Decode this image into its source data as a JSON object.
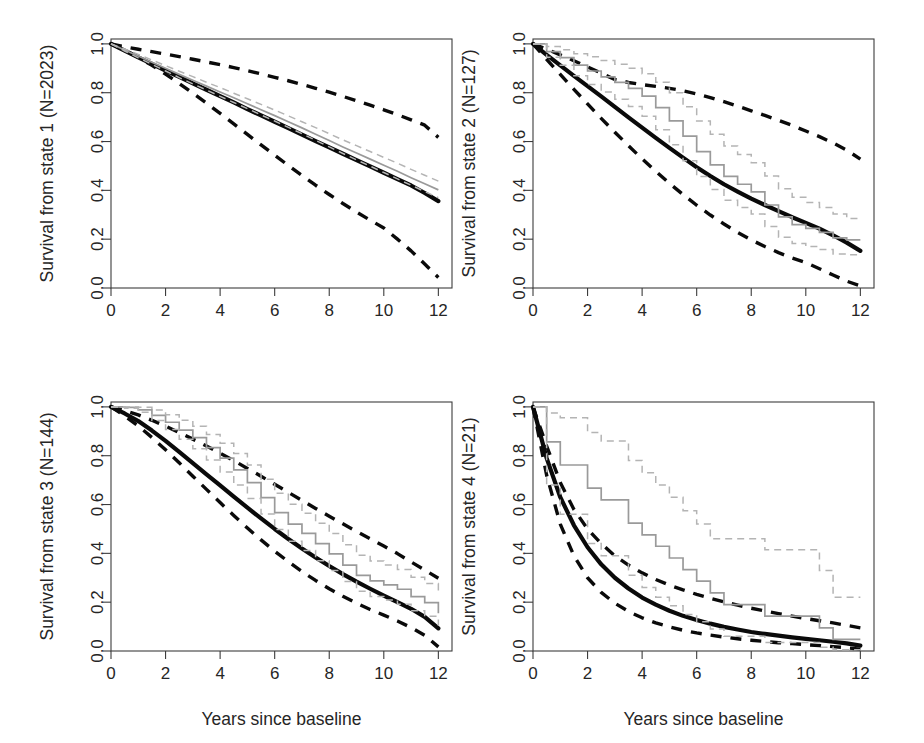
{
  "figure": {
    "title": "",
    "layout": "2x2 panel grid of survival curves",
    "xlabel": "Years since baseline",
    "panel_count": 4
  },
  "chart_data": [
    {
      "type": "line",
      "panel": 1,
      "title": "",
      "ylabel": "Survival from state 1 (N=2023)",
      "xlabel": "",
      "xlim": [
        0,
        12.5
      ],
      "ylim": [
        0,
        1.02
      ],
      "xticks": [
        0,
        2,
        4,
        6,
        8,
        10,
        12
      ],
      "xtick_labels": [
        "0",
        "2",
        "4",
        "6",
        "8",
        "10",
        "12"
      ],
      "yticks": [
        0.0,
        0.2,
        0.4,
        0.6,
        0.8,
        1.0
      ],
      "ytick_labels": [
        "0.0",
        "0.2",
        "0.4",
        "0.6",
        "0.8",
        "1.0"
      ],
      "grid": false,
      "legend": "none",
      "x": [
        0,
        0.5,
        1,
        1.5,
        2,
        2.5,
        3,
        3.5,
        4,
        4.5,
        5,
        5.5,
        6,
        6.5,
        7,
        7.5,
        8,
        8.5,
        9,
        9.5,
        10,
        10.5,
        11,
        11.5,
        12
      ],
      "series": [
        {
          "name": "model-fit",
          "style": "solid-thick-black",
          "values": [
            1.0,
            0.972,
            0.945,
            0.918,
            0.891,
            0.865,
            0.838,
            0.812,
            0.786,
            0.76,
            0.733,
            0.707,
            0.681,
            0.655,
            0.628,
            0.602,
            0.576,
            0.55,
            0.524,
            0.498,
            0.472,
            0.446,
            0.42,
            0.389,
            0.356
          ]
        },
        {
          "name": "model-ci-upper",
          "style": "dashed-thick-black",
          "values": [
            1.0,
            0.988,
            0.978,
            0.968,
            0.958,
            0.948,
            0.937,
            0.926,
            0.915,
            0.903,
            0.89,
            0.877,
            0.863,
            0.849,
            0.834,
            0.818,
            0.802,
            0.785,
            0.767,
            0.749,
            0.73,
            0.71,
            0.689,
            0.667,
            0.617
          ]
        },
        {
          "name": "model-ci-lower",
          "style": "dashed-thick-black",
          "values": [
            1.0,
            0.975,
            0.945,
            0.912,
            0.876,
            0.838,
            0.798,
            0.757,
            0.715,
            0.672,
            0.629,
            0.586,
            0.544,
            0.502,
            0.461,
            0.421,
            0.383,
            0.346,
            0.311,
            0.278,
            0.246,
            0.2,
            0.152,
            0.098,
            0.043
          ]
        },
        {
          "name": "kaplan-meier",
          "style": "solid-thin-gray",
          "values": [
            1.0,
            0.975,
            0.95,
            0.925,
            0.9,
            0.875,
            0.851,
            0.827,
            0.803,
            0.779,
            0.755,
            0.73,
            0.706,
            0.681,
            0.656,
            0.63,
            0.604,
            0.578,
            0.553,
            0.528,
            0.503,
            0.478,
            0.452,
            0.427,
            0.402
          ]
        },
        {
          "name": "kaplan-meier-ci-upper",
          "style": "dashed-thin-gray",
          "values": [
            1.0,
            0.979,
            0.957,
            0.934,
            0.911,
            0.888,
            0.866,
            0.843,
            0.821,
            0.798,
            0.775,
            0.752,
            0.729,
            0.705,
            0.681,
            0.657,
            0.632,
            0.607,
            0.583,
            0.559,
            0.535,
            0.511,
            0.486,
            0.462,
            0.438
          ]
        },
        {
          "name": "kaplan-meier-ci-lower",
          "style": "dashed-thin-gray",
          "values": [
            1.0,
            0.971,
            0.943,
            0.916,
            0.889,
            0.862,
            0.836,
            0.811,
            0.785,
            0.76,
            0.735,
            0.709,
            0.684,
            0.658,
            0.632,
            0.605,
            0.578,
            0.551,
            0.525,
            0.499,
            0.473,
            0.447,
            0.421,
            0.395,
            0.37
          ]
        }
      ]
    },
    {
      "type": "line",
      "panel": 2,
      "title": "",
      "ylabel": "Survival from state 2 (N=127)",
      "xlabel": "",
      "xlim": [
        0,
        12.5
      ],
      "ylim": [
        0,
        1.02
      ],
      "xticks": [
        0,
        2,
        4,
        6,
        8,
        10,
        12
      ],
      "xtick_labels": [
        "0",
        "2",
        "4",
        "6",
        "8",
        "10",
        "12"
      ],
      "yticks": [
        0.0,
        0.2,
        0.4,
        0.6,
        0.8,
        1.0
      ],
      "ytick_labels": [
        "0.0",
        "0.2",
        "0.4",
        "0.6",
        "0.8",
        "1.0"
      ],
      "grid": false,
      "legend": "none",
      "x": [
        0,
        0.5,
        1,
        1.5,
        2,
        2.5,
        3,
        3.5,
        4,
        4.5,
        5,
        5.5,
        6,
        6.5,
        7,
        7.5,
        8,
        8.5,
        9,
        9.5,
        10,
        10.5,
        11,
        11.5,
        12
      ],
      "series": [
        {
          "name": "model-fit",
          "style": "solid-thick-black",
          "values": [
            1.0,
            0.955,
            0.912,
            0.869,
            0.827,
            0.785,
            0.742,
            0.699,
            0.657,
            0.615,
            0.574,
            0.534,
            0.495,
            0.459,
            0.425,
            0.395,
            0.366,
            0.34,
            0.315,
            0.29,
            0.267,
            0.243,
            0.216,
            0.186,
            0.152
          ]
        },
        {
          "name": "model-ci-upper",
          "style": "dashed-thick-black",
          "values": [
            1.0,
            0.978,
            0.955,
            0.931,
            0.906,
            0.88,
            0.854,
            0.842,
            0.833,
            0.826,
            0.818,
            0.808,
            0.795,
            0.78,
            0.763,
            0.745,
            0.726,
            0.707,
            0.687,
            0.666,
            0.643,
            0.62,
            0.594,
            0.565,
            0.528
          ]
        },
        {
          "name": "model-ci-lower",
          "style": "dashed-thick-black",
          "values": [
            1.0,
            0.937,
            0.875,
            0.814,
            0.754,
            0.695,
            0.638,
            0.583,
            0.529,
            0.478,
            0.429,
            0.383,
            0.339,
            0.299,
            0.262,
            0.228,
            0.197,
            0.17,
            0.145,
            0.123,
            0.104,
            0.079,
            0.053,
            0.028,
            0.009
          ]
        },
        {
          "name": "kaplan-meier",
          "style": "solid-thin-gray-step",
          "values": [
            1.0,
            0.968,
            0.944,
            0.913,
            0.889,
            0.865,
            0.842,
            0.818,
            0.786,
            0.739,
            0.685,
            0.622,
            0.559,
            0.504,
            0.457,
            0.425,
            0.394,
            0.34,
            0.291,
            0.26,
            0.244,
            0.228,
            0.205,
            0.197,
            0.197
          ]
        },
        {
          "name": "kaplan-meier-ci-upper",
          "style": "dashed-thin-gray-step",
          "values": [
            1.0,
            0.989,
            0.976,
            0.96,
            0.947,
            0.932,
            0.917,
            0.9,
            0.878,
            0.843,
            0.8,
            0.742,
            0.684,
            0.63,
            0.582,
            0.547,
            0.513,
            0.459,
            0.407,
            0.372,
            0.35,
            0.33,
            0.303,
            0.285,
            0.277
          ]
        },
        {
          "name": "kaplan-meier-ci-lower",
          "style": "dashed-thin-gray-step",
          "values": [
            1.0,
            0.945,
            0.912,
            0.869,
            0.834,
            0.803,
            0.773,
            0.744,
            0.704,
            0.648,
            0.587,
            0.521,
            0.457,
            0.404,
            0.359,
            0.33,
            0.303,
            0.252,
            0.208,
            0.182,
            0.17,
            0.158,
            0.139,
            0.136,
            0.136
          ]
        }
      ]
    },
    {
      "type": "line",
      "panel": 3,
      "title": "",
      "ylabel": "Survival from state 3 (N=144)",
      "xlabel": "Years since baseline",
      "xlim": [
        0,
        12.5
      ],
      "ylim": [
        0,
        1.02
      ],
      "xticks": [
        0,
        2,
        4,
        6,
        8,
        10,
        12
      ],
      "xtick_labels": [
        "0",
        "2",
        "4",
        "6",
        "8",
        "10",
        "12"
      ],
      "yticks": [
        0.0,
        0.2,
        0.4,
        0.6,
        0.8,
        1.0
      ],
      "ytick_labels": [
        "0.0",
        "0.2",
        "0.4",
        "0.6",
        "0.8",
        "1.0"
      ],
      "grid": false,
      "legend": "none",
      "x": [
        0,
        0.5,
        1,
        1.5,
        2,
        2.5,
        3,
        3.5,
        4,
        4.5,
        5,
        5.5,
        6,
        6.5,
        7,
        7.5,
        8,
        8.5,
        9,
        9.5,
        10,
        10.5,
        11,
        11.5,
        12
      ],
      "series": [
        {
          "name": "model-fit",
          "style": "solid-thick-black",
          "values": [
            1.0,
            0.973,
            0.942,
            0.903,
            0.861,
            0.816,
            0.77,
            0.724,
            0.678,
            0.632,
            0.587,
            0.543,
            0.5,
            0.459,
            0.42,
            0.383,
            0.348,
            0.315,
            0.284,
            0.255,
            0.227,
            0.2,
            0.173,
            0.14,
            0.093
          ]
        },
        {
          "name": "model-ci-upper",
          "style": "dashed-thick-black",
          "values": [
            1.0,
            0.985,
            0.967,
            0.945,
            0.921,
            0.895,
            0.868,
            0.84,
            0.81,
            0.78,
            0.748,
            0.716,
            0.683,
            0.65,
            0.617,
            0.584,
            0.552,
            0.521,
            0.49,
            0.46,
            0.43,
            0.399,
            0.365,
            0.332,
            0.298
          ]
        },
        {
          "name": "model-ci-lower",
          "style": "dashed-thick-black",
          "values": [
            1.0,
            0.963,
            0.922,
            0.875,
            0.824,
            0.771,
            0.716,
            0.662,
            0.608,
            0.555,
            0.504,
            0.455,
            0.409,
            0.366,
            0.326,
            0.289,
            0.255,
            0.224,
            0.196,
            0.17,
            0.147,
            0.123,
            0.096,
            0.064,
            0.017
          ]
        },
        {
          "name": "kaplan-meier",
          "style": "solid-thin-gray-step",
          "values": [
            1.0,
            0.998,
            0.988,
            0.965,
            0.937,
            0.905,
            0.874,
            0.833,
            0.79,
            0.742,
            0.69,
            0.628,
            0.567,
            0.52,
            0.482,
            0.44,
            0.398,
            0.352,
            0.31,
            0.287,
            0.271,
            0.253,
            0.223,
            0.198,
            0.155
          ]
        },
        {
          "name": "kaplan-meier-ci-upper",
          "style": "dashed-thin-gray-step",
          "values": [
            1.0,
            1.0,
            0.998,
            0.987,
            0.968,
            0.945,
            0.921,
            0.887,
            0.851,
            0.809,
            0.762,
            0.704,
            0.646,
            0.601,
            0.564,
            0.523,
            0.481,
            0.435,
            0.392,
            0.369,
            0.352,
            0.334,
            0.302,
            0.276,
            0.233
          ]
        },
        {
          "name": "kaplan-meier-ci-lower",
          "style": "dashed-thin-gray-step",
          "values": [
            1.0,
            0.994,
            0.978,
            0.944,
            0.907,
            0.867,
            0.829,
            0.782,
            0.733,
            0.68,
            0.625,
            0.561,
            0.498,
            0.45,
            0.412,
            0.37,
            0.33,
            0.285,
            0.245,
            0.223,
            0.209,
            0.192,
            0.165,
            0.142,
            0.103
          ]
        }
      ]
    },
    {
      "type": "line",
      "panel": 4,
      "title": "",
      "ylabel": "Survival from state 4 (N=21)",
      "xlabel": "Years since baseline",
      "xlim": [
        0,
        12.5
      ],
      "ylim": [
        0,
        1.02
      ],
      "xticks": [
        0,
        2,
        4,
        6,
        8,
        10,
        12
      ],
      "xtick_labels": [
        "0",
        "2",
        "4",
        "6",
        "8",
        "10",
        "12"
      ],
      "yticks": [
        0.0,
        0.2,
        0.4,
        0.6,
        0.8,
        1.0
      ],
      "ytick_labels": [
        "0.0",
        "0.2",
        "0.4",
        "0.6",
        "0.8",
        "1.0"
      ],
      "grid": false,
      "legend": "none",
      "x": [
        0,
        0.5,
        1,
        1.5,
        2,
        2.5,
        3,
        3.5,
        4,
        4.5,
        5,
        5.5,
        6,
        6.5,
        7,
        7.5,
        8,
        8.5,
        9,
        9.5,
        10,
        10.5,
        11,
        11.5,
        12
      ],
      "series": [
        {
          "name": "model-fit",
          "style": "solid-thick-black",
          "values": [
            1.0,
            0.79,
            0.63,
            0.515,
            0.425,
            0.355,
            0.3,
            0.256,
            0.219,
            0.19,
            0.165,
            0.144,
            0.127,
            0.112,
            0.099,
            0.088,
            0.078,
            0.07,
            0.063,
            0.056,
            0.05,
            0.044,
            0.038,
            0.031,
            0.022
          ]
        },
        {
          "name": "model-ci-upper",
          "style": "dashed-thick-black",
          "values": [
            1.0,
            0.84,
            0.69,
            0.58,
            0.5,
            0.44,
            0.39,
            0.352,
            0.32,
            0.293,
            0.27,
            0.25,
            0.232,
            0.216,
            0.201,
            0.188,
            0.175,
            0.164,
            0.153,
            0.143,
            0.133,
            0.124,
            0.115,
            0.105,
            0.095
          ]
        },
        {
          "name": "model-ci-lower",
          "style": "dashed-thick-black",
          "values": [
            1.0,
            0.72,
            0.52,
            0.39,
            0.3,
            0.24,
            0.196,
            0.162,
            0.136,
            0.115,
            0.099,
            0.085,
            0.074,
            0.065,
            0.057,
            0.05,
            0.044,
            0.039,
            0.034,
            0.03,
            0.026,
            0.022,
            0.018,
            0.013,
            0.007
          ]
        },
        {
          "name": "kaplan-meier",
          "style": "solid-thin-gray-step",
          "values": [
            1.0,
            0.857,
            0.762,
            0.762,
            0.667,
            0.619,
            0.619,
            0.524,
            0.476,
            0.429,
            0.381,
            0.333,
            0.286,
            0.238,
            0.19,
            0.19,
            0.19,
            0.143,
            0.143,
            0.143,
            0.143,
            0.095,
            0.048,
            0.048,
            0.048
          ]
        },
        {
          "name": "kaplan-meier-ci-upper",
          "style": "dashed-thin-gray-step",
          "values": [
            1.0,
            0.975,
            0.955,
            0.955,
            0.895,
            0.86,
            0.86,
            0.78,
            0.73,
            0.68,
            0.63,
            0.575,
            0.52,
            0.46,
            0.46,
            0.46,
            0.46,
            0.415,
            0.415,
            0.415,
            0.415,
            0.33,
            0.22,
            0.22,
            0.22
          ]
        },
        {
          "name": "kaplan-meier-ci-lower",
          "style": "dashed-thin-gray-step",
          "values": [
            1.0,
            0.68,
            0.56,
            0.56,
            0.44,
            0.39,
            0.39,
            0.31,
            0.26,
            0.22,
            0.185,
            0.15,
            0.12,
            0.09,
            0.06,
            0.06,
            0.06,
            0.035,
            0.035,
            0.035,
            0.035,
            0.015,
            0.005,
            0.005,
            0.005
          ]
        }
      ]
    }
  ],
  "panels": [
    {
      "ylabel": "Survival from state 1 (N=2023)",
      "xlabel": ""
    },
    {
      "ylabel": "Survival from state 2 (N=127)",
      "xlabel": ""
    },
    {
      "ylabel": "Survival from state 3 (N=144)",
      "xlabel": "Years since baseline"
    },
    {
      "ylabel": "Survival from state 4 (N=21)",
      "xlabel": "Years since baseline"
    }
  ],
  "colors": {
    "model": "#0a0a0a",
    "kaplan_meier": "#9a9a9a",
    "kaplan_meier_ci": "#b4b4b4",
    "axis": "#3c3c3c",
    "background": "#ffffff"
  }
}
